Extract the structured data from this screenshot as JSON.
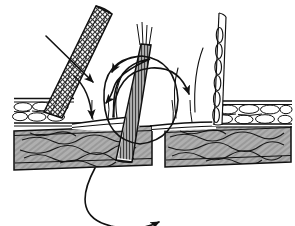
{
  "figure": {
    "title": "Sectional line-art diagram of a fibrous band passing through a layered tissue wall",
    "medium": "pen-and-ink line drawing",
    "background_color": "#ffffff",
    "ink_color": "#111111",
    "width": 295,
    "height": 226,
    "caption": "",
    "labels": [],
    "axis_text": [],
    "legend_text": []
  },
  "structures": [
    {
      "id": "left-slab",
      "name": "left lower slab",
      "texture": "dense wavy fibrous hatching",
      "fill_tone": "#8d8d8d",
      "x": 14,
      "y": 131,
      "width": 139,
      "height": 39
    },
    {
      "id": "right-slab",
      "name": "right lower slab",
      "texture": "dense wavy fibrous hatching",
      "fill_tone": "#8d8d8d",
      "x": 163,
      "y": 128,
      "width": 128,
      "height": 39
    },
    {
      "id": "left-cobble-layer",
      "name": "left cobblestone cell layer",
      "texture": "rounded cobble cells in two rows",
      "fill_tone": "#ffffff",
      "x": 14,
      "y": 97,
      "width": 60,
      "height": 28
    },
    {
      "id": "right-cobble-layer",
      "name": "right cobblestone cell layer",
      "texture": "rounded cobble cells in two rows",
      "fill_tone": "#ffffff",
      "x": 216,
      "y": 100,
      "width": 76,
      "height": 26
    },
    {
      "id": "left-diagonal-band",
      "name": "left diagonal braided band",
      "texture": "braided mesh crosshatch",
      "fill_tone": "#6b6b6b",
      "angle_deg": -62
    },
    {
      "id": "center-band",
      "name": "central near-vertical fibrous band",
      "texture": "fine longitudinal striation",
      "fill_tone": "#5c5c5c",
      "angle_deg": -80
    },
    {
      "id": "right-vertical-band",
      "name": "right vertical chain-of-cells band",
      "texture": "stacked elongated cells",
      "fill_tone": "#ffffff",
      "angle_deg": -88
    }
  ],
  "arrows": [
    {
      "id": "arrow-straight-upper-left",
      "name": "straight arrow crossing left band",
      "kind": "straight",
      "direction": "down-right",
      "head": "solid triangle"
    },
    {
      "id": "arrow-left-descend",
      "name": "curved arrow descending on left of center",
      "kind": "curved",
      "direction": "down",
      "head": "solid triangle"
    },
    {
      "id": "arrow-arc-to-left",
      "name": "arc sweeping leftward over center band",
      "kind": "curved",
      "direction": "left",
      "head": "solid triangle"
    },
    {
      "id": "arrow-arc-to-right",
      "name": "arc sweeping rightward over center band",
      "kind": "curved",
      "direction": "up-right",
      "head": "solid triangle"
    },
    {
      "id": "arrow-center-loop",
      "name": "large circular recirculation loop at center",
      "kind": "closed-loop",
      "direction": "clockwise",
      "head": "solid triangle"
    },
    {
      "id": "arrow-bottom-loop",
      "name": "wide U-shaped loop below the slabs",
      "kind": "curved",
      "direction": "rightward along bottom",
      "head": "solid triangle"
    }
  ]
}
